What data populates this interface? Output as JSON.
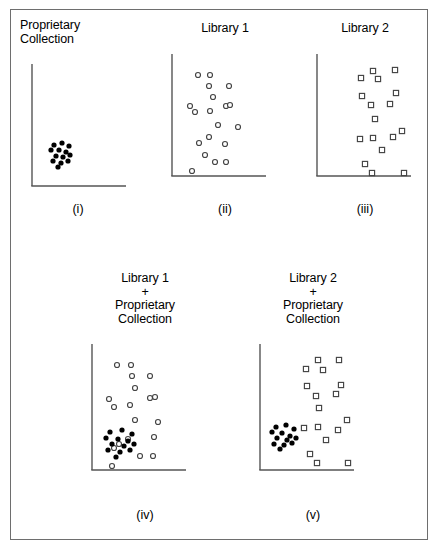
{
  "figure": {
    "caption": "",
    "frame_color": "#6e6e6e",
    "axis_color": "#555555",
    "marker_colors": {
      "proprietary_fill": "#000000",
      "library_stroke": "#444444",
      "library_fill": "#ffffff"
    }
  },
  "panels": [
    {
      "id": "i",
      "title": "Proprietary\nCollection",
      "label": "(i)",
      "title_align": "left",
      "box": {
        "left": 18,
        "top": 18,
        "width": 120,
        "height": 210
      },
      "title_box": {
        "left": 20,
        "top": 19,
        "width": 118
      },
      "label_box": {
        "left": 18,
        "top": 202,
        "width": 120
      },
      "axes": {
        "x0": 14,
        "y0": 10,
        "x1": 108,
        "y1": 118
      },
      "series": [
        {
          "name": "Proprietary Collection",
          "marker": "filled-circle",
          "points": [
            [
              22,
              81
            ],
            [
              30,
              79
            ],
            [
              37,
              82
            ],
            [
              19,
              86
            ],
            [
              27,
              86
            ],
            [
              34,
              88
            ],
            [
              24,
              92
            ],
            [
              31,
              93
            ],
            [
              38,
              91
            ],
            [
              21,
              97
            ],
            [
              29,
              99
            ],
            [
              36,
              97
            ],
            [
              26,
              103
            ]
          ]
        }
      ]
    },
    {
      "id": "ii",
      "title": "Library 1",
      "label": "(ii)",
      "title_align": "center",
      "box": {
        "left": 160,
        "top": 18,
        "width": 130,
        "height": 210
      },
      "title_box": {
        "left": 160,
        "top": 22,
        "width": 130
      },
      "label_box": {
        "left": 160,
        "top": 202,
        "width": 130
      },
      "axes": {
        "x0": 12,
        "y0": 10,
        "x1": 106,
        "y1": 118
      },
      "series": [
        {
          "name": "Library 1",
          "marker": "open-circle",
          "points": [
            [
              26,
              21
            ],
            [
              38,
              21
            ],
            [
              37,
              32
            ],
            [
              57,
              32
            ],
            [
              41,
              43
            ],
            [
              18,
              52
            ],
            [
              54,
              52
            ],
            [
              58,
              51
            ],
            [
              23,
              58
            ],
            [
              38,
              57
            ],
            [
              46,
              71
            ],
            [
              66,
              73
            ],
            [
              37,
              83
            ],
            [
              27,
              89
            ],
            [
              53,
              90
            ],
            [
              33,
              101
            ],
            [
              43,
              108
            ],
            [
              54,
              108
            ],
            [
              20,
              117
            ]
          ]
        }
      ]
    },
    {
      "id": "iii",
      "title": "Library 2",
      "label": "(iii)",
      "title_align": "center",
      "box": {
        "left": 305,
        "top": 18,
        "width": 130,
        "height": 210
      },
      "title_box": {
        "left": 300,
        "top": 22,
        "width": 130
      },
      "label_box": {
        "left": 300,
        "top": 202,
        "width": 130
      },
      "axes": {
        "x0": 12,
        "y0": 10,
        "x1": 106,
        "y1": 118
      },
      "series": [
        {
          "name": "Library 2",
          "marker": "open-square",
          "points": [
            [
              56,
              17
            ],
            [
              78,
              16
            ],
            [
              44,
              24
            ],
            [
              61,
              25
            ],
            [
              45,
              42
            ],
            [
              79,
              39
            ],
            [
              54,
              51
            ],
            [
              73,
              50
            ],
            [
              58,
              65
            ],
            [
              85,
              77
            ],
            [
              43,
              85
            ],
            [
              56,
              84
            ],
            [
              76,
              83
            ],
            [
              65,
              96
            ],
            [
              48,
              110
            ],
            [
              55,
              119
            ],
            [
              87,
              119
            ]
          ]
        }
      ]
    },
    {
      "id": "iv",
      "title": "Library 1\n+\nProprietary\nCollection",
      "label": "(iv)",
      "title_align": "center",
      "box": {
        "left": 80,
        "top": 272,
        "width": 130,
        "height": 260
      },
      "title_box": {
        "left": 78,
        "top": 272,
        "width": 134
      },
      "label_box": {
        "left": 78,
        "top": 508,
        "width": 134
      },
      "axes": {
        "x0": 12,
        "y0": 10,
        "x1": 106,
        "y1": 122
      },
      "series": [
        {
          "name": "Library 1",
          "marker": "open-circle",
          "points": [
            [
              25,
              21
            ],
            [
              39,
              21
            ],
            [
              40,
              32
            ],
            [
              58,
              32
            ],
            [
              43,
              44
            ],
            [
              17,
              55
            ],
            [
              58,
              54
            ],
            [
              63,
              53
            ],
            [
              22,
              63
            ],
            [
              38,
              61
            ],
            [
              43,
              76
            ],
            [
              66,
              78
            ],
            [
              62,
              93
            ],
            [
              36,
              95
            ],
            [
              27,
              100
            ],
            [
              22,
              104
            ],
            [
              48,
              112
            ],
            [
              61,
              112
            ],
            [
              20,
              122
            ]
          ]
        },
        {
          "name": "Proprietary Collection",
          "marker": "filled-circle",
          "points": [
            [
              18,
              88
            ],
            [
              30,
              86
            ],
            [
              40,
              90
            ],
            [
              14,
              94
            ],
            [
              26,
              95
            ],
            [
              36,
              97
            ],
            [
              20,
              100
            ],
            [
              32,
              102
            ],
            [
              42,
              100
            ],
            [
              16,
              106
            ],
            [
              28,
              108
            ],
            [
              38,
              106
            ],
            [
              24,
              113
            ]
          ]
        }
      ]
    },
    {
      "id": "v",
      "title": "Library 2\n+\nProprietary\nCollection",
      "label": "(v)",
      "title_align": "center",
      "box": {
        "left": 248,
        "top": 272,
        "width": 130,
        "height": 260
      },
      "title_box": {
        "left": 246,
        "top": 272,
        "width": 134
      },
      "label_box": {
        "left": 246,
        "top": 508,
        "width": 134
      },
      "axes": {
        "x0": 12,
        "y0": 10,
        "x1": 106,
        "y1": 122
      },
      "series": [
        {
          "name": "Library 2",
          "marker": "open-square",
          "points": [
            [
              58,
              16
            ],
            [
              79,
              16
            ],
            [
              46,
              25
            ],
            [
              63,
              26
            ],
            [
              47,
              42
            ],
            [
              81,
              41
            ],
            [
              56,
              52
            ],
            [
              76,
              50
            ],
            [
              59,
              64
            ],
            [
              87,
              76
            ],
            [
              44,
              84
            ],
            [
              58,
              83
            ],
            [
              78,
              86
            ],
            [
              66,
              96
            ],
            [
              50,
              110
            ],
            [
              57,
              119
            ],
            [
              88,
              119
            ]
          ]
        },
        {
          "name": "Proprietary Collection",
          "marker": "filled-circle",
          "points": [
            [
              16,
              83
            ],
            [
              26,
              81
            ],
            [
              34,
              85
            ],
            [
              12,
              88
            ],
            [
              22,
              89
            ],
            [
              30,
              92
            ],
            [
              17,
              94
            ],
            [
              27,
              96
            ],
            [
              36,
              94
            ],
            [
              14,
              100
            ],
            [
              24,
              101
            ],
            [
              32,
              99
            ],
            [
              20,
              105
            ]
          ]
        }
      ]
    }
  ],
  "chart_data": {
    "type": "scatter",
    "xlabel": "",
    "ylabel": "",
    "grid": false,
    "legend": "none",
    "panel_count": 5,
    "panels": [
      {
        "label": "(i)",
        "title": "Proprietary Collection",
        "series_names": [
          "Proprietary Collection"
        ],
        "marker_styles": [
          "filled-circle"
        ],
        "point_counts": [
          13
        ]
      },
      {
        "label": "(ii)",
        "title": "Library 1",
        "series_names": [
          "Library 1"
        ],
        "marker_styles": [
          "open-circle"
        ],
        "point_counts": [
          19
        ]
      },
      {
        "label": "(iii)",
        "title": "Library 2",
        "series_names": [
          "Library 2"
        ],
        "marker_styles": [
          "open-square"
        ],
        "point_counts": [
          17
        ]
      },
      {
        "label": "(iv)",
        "title": "Library 1 + Proprietary Collection",
        "series_names": [
          "Library 1",
          "Proprietary Collection"
        ],
        "marker_styles": [
          "open-circle",
          "filled-circle"
        ],
        "point_counts": [
          19,
          13
        ]
      },
      {
        "label": "(v)",
        "title": "Library 2 + Proprietary Collection",
        "series_names": [
          "Library 2",
          "Proprietary Collection"
        ],
        "marker_styles": [
          "open-square",
          "filled-circle"
        ],
        "point_counts": [
          17,
          13
        ]
      }
    ]
  }
}
